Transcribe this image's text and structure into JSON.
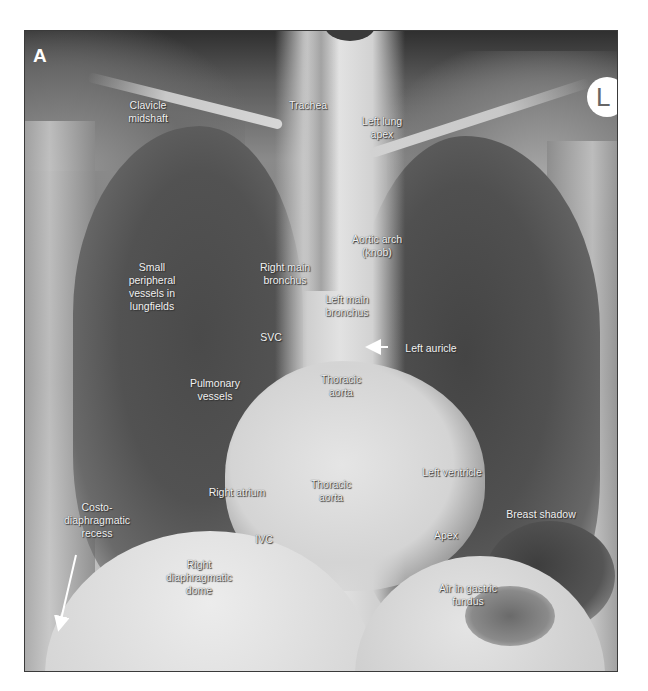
{
  "figure": {
    "panel_letter": "A",
    "side_marker": "L",
    "image_type": "Posteroanterior chest X-ray (radiograph)",
    "labels": [
      {
        "id": "clavicle-midshaft",
        "text": "Clavicle\nmidshaft",
        "x": 123,
        "y": 68
      },
      {
        "id": "trachea",
        "text": "Trachea",
        "x": 283,
        "y": 68
      },
      {
        "id": "left-lung-apex",
        "text": "Left lung\napex",
        "x": 357,
        "y": 84
      },
      {
        "id": "aortic-arch",
        "text": "Aortic arch\n(knob)",
        "x": 352,
        "y": 202
      },
      {
        "id": "small-peripheral-vessels",
        "text": "Small\nperipheral\nvessels in\nlungfields",
        "x": 127,
        "y": 230
      },
      {
        "id": "right-main-bronchus",
        "text": "Right main\nbronchus",
        "x": 260,
        "y": 230
      },
      {
        "id": "left-main-bronchus",
        "text": "Left main\nbronchus",
        "x": 322,
        "y": 262
      },
      {
        "id": "svc",
        "text": "SVC",
        "x": 246,
        "y": 300
      },
      {
        "id": "left-auricle",
        "text": "Left auricle",
        "x": 406,
        "y": 311
      },
      {
        "id": "pulmonary-vessels",
        "text": "Pulmonary\nvessels",
        "x": 190,
        "y": 346
      },
      {
        "id": "thoracic-aorta-upper",
        "text": "Thoracic\naorta",
        "x": 316,
        "y": 342
      },
      {
        "id": "left-ventricle",
        "text": "Left ventricle",
        "x": 427,
        "y": 435
      },
      {
        "id": "right-atrium",
        "text": "Right atrium",
        "x": 212,
        "y": 455
      },
      {
        "id": "thoracic-aorta-lower",
        "text": "Thoracic\naorta",
        "x": 306,
        "y": 447
      },
      {
        "id": "costo-diaphragmatic-recess",
        "text": "Costo-\ndiaphragmatic\nrecess",
        "x": 72,
        "y": 470
      },
      {
        "id": "breast-shadow",
        "text": "Breast shadow",
        "x": 516,
        "y": 477
      },
      {
        "id": "apex",
        "text": "Apex",
        "x": 421,
        "y": 498
      },
      {
        "id": "ivc",
        "text": "IVC",
        "x": 239,
        "y": 502
      },
      {
        "id": "right-diaphragmatic-dome",
        "text": "Right\ndiaphragmatic\ndome",
        "x": 174,
        "y": 527
      },
      {
        "id": "air-in-gastric-fundus",
        "text": "Air in gastric\nfundus",
        "x": 443,
        "y": 551
      }
    ],
    "arrows": [
      {
        "id": "left-auricle-arrow",
        "from": [
          363,
          316
        ],
        "to": [
          346,
          316
        ]
      },
      {
        "id": "costo-recess-arrow",
        "from": [
          51,
          524
        ],
        "to": [
          34,
          595
        ]
      }
    ]
  }
}
